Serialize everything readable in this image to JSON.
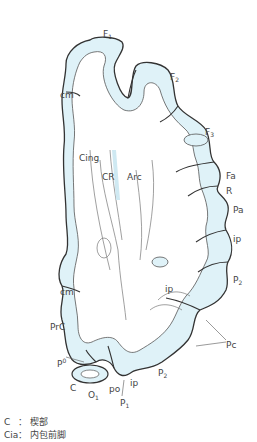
{
  "figure": {
    "colors": {
      "cortex_fill": "#dff2f8",
      "outline": "#333333",
      "inner_line": "#777777",
      "label_text": "#444444",
      "background": "#ffffff"
    },
    "labels": [
      {
        "id": "F1",
        "text": "F",
        "sub": "1",
        "x": 103,
        "y": 30
      },
      {
        "id": "F2",
        "text": "F",
        "sub": "2",
        "x": 170,
        "y": 73
      },
      {
        "id": "F3",
        "text": "F",
        "sub": "3",
        "x": 205,
        "y": 128
      },
      {
        "id": "cm-top",
        "text": "cm",
        "x": 60,
        "y": 91
      },
      {
        "id": "Cing",
        "text": "Cing",
        "x": 79,
        "y": 154
      },
      {
        "id": "CR",
        "text": "CR",
        "x": 102,
        "y": 173
      },
      {
        "id": "Arc",
        "text": "Arc",
        "x": 127,
        "y": 173
      },
      {
        "id": "Fa",
        "text": "Fa",
        "x": 226,
        "y": 172
      },
      {
        "id": "R",
        "text": "R",
        "x": 226,
        "y": 187
      },
      {
        "id": "Pa",
        "text": "Pa",
        "x": 233,
        "y": 206
      },
      {
        "id": "ip-right",
        "text": "ip",
        "x": 233,
        "y": 235
      },
      {
        "id": "P2-right",
        "text": "P",
        "sub": "2",
        "x": 233,
        "y": 276
      },
      {
        "id": "ip-mid",
        "text": "ip",
        "x": 165,
        "y": 285
      },
      {
        "id": "cm-bottom",
        "text": "cm",
        "x": 60,
        "y": 288
      },
      {
        "id": "PrC",
        "text": "PrC",
        "x": 50,
        "y": 323
      },
      {
        "id": "Pc",
        "text": "Pc",
        "x": 226,
        "y": 341
      },
      {
        "id": "P0",
        "text": "P",
        "sup": "0",
        "x": 57,
        "y": 358
      },
      {
        "id": "C",
        "text": "C",
        "x": 70,
        "y": 384
      },
      {
        "id": "P2-bottom",
        "text": "P",
        "sub": "2",
        "x": 158,
        "y": 369
      },
      {
        "id": "ip-bottom",
        "text": "ip",
        "x": 130,
        "y": 379
      },
      {
        "id": "po",
        "text": "po",
        "x": 109,
        "y": 385
      },
      {
        "id": "O1",
        "text": "O",
        "sub": "1",
        "x": 88,
        "y": 391
      },
      {
        "id": "P1",
        "text": "P",
        "sub": "1",
        "x": 120,
        "y": 399
      }
    ]
  },
  "legend": [
    {
      "key": "C",
      "sep": "：",
      "value": "楔部"
    },
    {
      "key": "Cia",
      "sep": "：",
      "value": "内包前脚"
    }
  ]
}
